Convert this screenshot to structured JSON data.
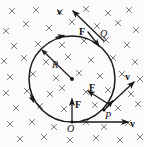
{
  "figure": {
    "background_color": "#fbfbfb",
    "stroke_color": "#1a1a1a",
    "field_mark_color": "#6b6b6b",
    "field_symbol": "x",
    "field_meaning": "magnetic-field-into-page",
    "orbit": {
      "center_x": 72,
      "center_y": 79,
      "radius": 43
    }
  },
  "labels": {
    "velocity_top": "v",
    "velocity_right": "v",
    "velocity_bottom": "v",
    "force_top": "F",
    "force_right": "F",
    "force_bottom": "F",
    "radius": "R",
    "point_q": "Q",
    "point_p": "P",
    "point_o": "O"
  },
  "field_marks": [
    {
      "x": 12,
      "y": 11
    },
    {
      "x": 36,
      "y": 10
    },
    {
      "x": 60,
      "y": 12
    },
    {
      "x": 86,
      "y": 9
    },
    {
      "x": 108,
      "y": 13
    },
    {
      "x": 129,
      "y": 10
    },
    {
      "x": 6,
      "y": 31
    },
    {
      "x": 26,
      "y": 24
    },
    {
      "x": 49,
      "y": 28
    },
    {
      "x": 72,
      "y": 22
    },
    {
      "x": 97,
      "y": 26
    },
    {
      "x": 118,
      "y": 23
    },
    {
      "x": 136,
      "y": 30
    },
    {
      "x": 14,
      "y": 46
    },
    {
      "x": 38,
      "y": 44
    },
    {
      "x": 62,
      "y": 45
    },
    {
      "x": 84,
      "y": 41
    },
    {
      "x": 106,
      "y": 40
    },
    {
      "x": 127,
      "y": 45
    },
    {
      "x": 4,
      "y": 61
    },
    {
      "x": 24,
      "y": 58
    },
    {
      "x": 46,
      "y": 62
    },
    {
      "x": 68,
      "y": 57
    },
    {
      "x": 91,
      "y": 60
    },
    {
      "x": 113,
      "y": 58
    },
    {
      "x": 135,
      "y": 62
    },
    {
      "x": 10,
      "y": 77
    },
    {
      "x": 33,
      "y": 74
    },
    {
      "x": 56,
      "y": 78
    },
    {
      "x": 79,
      "y": 73
    },
    {
      "x": 100,
      "y": 76
    },
    {
      "x": 122,
      "y": 74
    },
    {
      "x": 140,
      "y": 79
    },
    {
      "x": 6,
      "y": 93
    },
    {
      "x": 27,
      "y": 91
    },
    {
      "x": 50,
      "y": 94
    },
    {
      "x": 62,
      "y": 88
    },
    {
      "x": 86,
      "y": 92
    },
    {
      "x": 108,
      "y": 90
    },
    {
      "x": 131,
      "y": 94
    },
    {
      "x": 16,
      "y": 108
    },
    {
      "x": 40,
      "y": 106
    },
    {
      "x": 64,
      "y": 109
    },
    {
      "x": 95,
      "y": 105
    },
    {
      "x": 118,
      "y": 108
    },
    {
      "x": 138,
      "y": 104
    },
    {
      "x": 10,
      "y": 124
    },
    {
      "x": 32,
      "y": 122
    },
    {
      "x": 54,
      "y": 127
    },
    {
      "x": 86,
      "y": 122
    },
    {
      "x": 104,
      "y": 127
    },
    {
      "x": 128,
      "y": 123
    },
    {
      "x": 20,
      "y": 139
    },
    {
      "x": 44,
      "y": 137
    },
    {
      "x": 70,
      "y": 140
    },
    {
      "x": 96,
      "y": 138
    },
    {
      "x": 120,
      "y": 140
    },
    {
      "x": 140,
      "y": 137
    }
  ],
  "vectors": [
    {
      "name": "velocity-at-q",
      "label": "v",
      "from_x": 104,
      "from_y": 41,
      "to_x": 73,
      "to_y": 11
    },
    {
      "name": "force-at-q",
      "label": "F",
      "from_x": 88,
      "from_y": 32,
      "to_x": 99,
      "to_y": 46
    },
    {
      "name": "velocity-at-p",
      "label": "v",
      "from_x": 104,
      "from_y": 110,
      "to_x": 134,
      "to_y": 82
    },
    {
      "name": "force-at-p",
      "label": "F",
      "from_x": 110,
      "from_y": 105,
      "to_x": 88,
      "to_y": 91
    },
    {
      "name": "velocity-at-o",
      "label": "v",
      "from_x": 72,
      "from_y": 122,
      "to_x": 128,
      "to_y": 122
    },
    {
      "name": "force-at-o",
      "label": "F",
      "from_x": 72,
      "from_y": 122,
      "to_x": 72,
      "to_y": 99
    },
    {
      "name": "radius-vector",
      "label": "R",
      "from_x": 72,
      "from_y": 79,
      "to_x": 42,
      "to_y": 50
    }
  ]
}
